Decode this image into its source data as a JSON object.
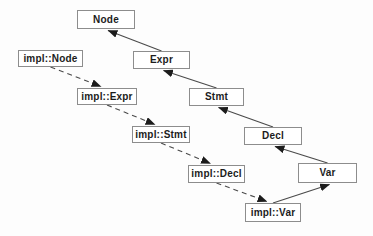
{
  "diagram": {
    "colors": {
      "background": "#fdfdfd",
      "box_fill": "#ffffff",
      "box_border": "#8d8d8d",
      "text": "#1c1c1c",
      "edge": "#4a4a4a",
      "arrowhead": "#1c1c1c"
    },
    "nodes": [
      {
        "id": "Node",
        "label": "Node",
        "x": 77,
        "y": 10,
        "w": 58,
        "h": 19
      },
      {
        "id": "Expr",
        "label": "Expr",
        "x": 133,
        "y": 51,
        "w": 57,
        "h": 18
      },
      {
        "id": "Stmt",
        "label": "Stmt",
        "x": 189,
        "y": 88,
        "w": 55,
        "h": 18
      },
      {
        "id": "Decl",
        "label": "Decl",
        "x": 244,
        "y": 127,
        "w": 58,
        "h": 18
      },
      {
        "id": "Var",
        "label": "Var",
        "x": 298,
        "y": 163,
        "w": 59,
        "h": 20
      },
      {
        "id": "implNode",
        "label": "impl::Node",
        "x": 18,
        "y": 50,
        "w": 65,
        "h": 17
      },
      {
        "id": "implExpr",
        "label": "impl::Expr",
        "x": 77,
        "y": 88,
        "w": 60,
        "h": 17
      },
      {
        "id": "implStmt",
        "label": "impl::Stmt",
        "x": 132,
        "y": 126,
        "w": 58,
        "h": 17
      },
      {
        "id": "implDecl",
        "label": "impl::Decl",
        "x": 188,
        "y": 165,
        "w": 57,
        "h": 18
      },
      {
        "id": "implVar",
        "label": "impl::Var",
        "x": 245,
        "y": 203,
        "w": 56,
        "h": 19
      }
    ],
    "edges": [
      {
        "from": "Expr",
        "to": "Node",
        "style": "solid"
      },
      {
        "from": "Stmt",
        "to": "Expr",
        "style": "solid"
      },
      {
        "from": "Decl",
        "to": "Stmt",
        "style": "solid"
      },
      {
        "from": "Var",
        "to": "Decl",
        "style": "solid"
      },
      {
        "from": "implVar",
        "to": "Var",
        "style": "solid"
      },
      {
        "from": "implNode",
        "to": "implExpr",
        "style": "dashed"
      },
      {
        "from": "implExpr",
        "to": "implStmt",
        "style": "dashed"
      },
      {
        "from": "implStmt",
        "to": "implDecl",
        "style": "dashed"
      },
      {
        "from": "implDecl",
        "to": "implVar",
        "style": "dashed"
      }
    ]
  }
}
